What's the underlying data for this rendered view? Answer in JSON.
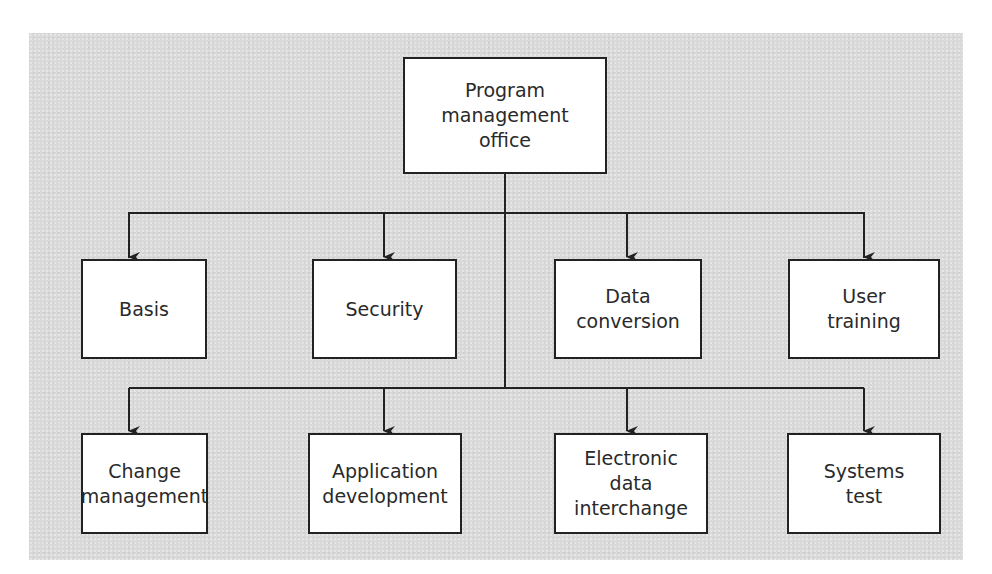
{
  "diagram": {
    "type": "org-chart",
    "colors": {
      "background_panel": "#d9d9d9",
      "box_fill": "#ffffff",
      "line": "#222222",
      "text": "#2a2a2a"
    },
    "root": {
      "label": "Program\nmanagement\noffice"
    },
    "row1": [
      {
        "label": "Basis"
      },
      {
        "label": "Security"
      },
      {
        "label": "Data\nconversion"
      },
      {
        "label": "User\ntraining"
      }
    ],
    "row2": [
      {
        "label": "Change\nmanagement"
      },
      {
        "label": "Application\ndevelopment"
      },
      {
        "label": "Electronic\ndata\ninterchange"
      },
      {
        "label": "Systems\ntest"
      }
    ],
    "edges": [
      [
        "Program management office",
        "Basis"
      ],
      [
        "Program management office",
        "Security"
      ],
      [
        "Program management office",
        "Data conversion"
      ],
      [
        "Program management office",
        "User training"
      ],
      [
        "Program management office",
        "Change management"
      ],
      [
        "Program management office",
        "Application development"
      ],
      [
        "Program management office",
        "Electronic data interchange"
      ],
      [
        "Program management office",
        "Systems test"
      ]
    ]
  }
}
